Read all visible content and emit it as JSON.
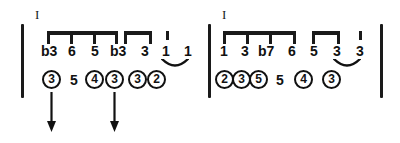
{
  "figure": {
    "type": "music-notation-diagram"
  },
  "colors": {
    "ink": "#111111",
    "rule": "#1a1a1a",
    "paper": "#ffffff"
  },
  "measures": [
    {
      "id": "measure-1",
      "roman_numeral": "I",
      "barlines": [
        {
          "name": "opening",
          "x": 21,
          "y": 24,
          "height": 74
        }
      ],
      "beam_groups": [
        {
          "id": "beam-group-1",
          "x": 47,
          "y": 31,
          "width": 71,
          "tick_offsets": [
            0,
            23,
            46,
            68
          ]
        },
        {
          "id": "beam-group-2",
          "x": 124,
          "y": 31,
          "width": 28,
          "tick_offsets": [
            0,
            25
          ]
        }
      ],
      "stem_ticks": [
        {
          "id": "stem-tick-1",
          "x": 166,
          "y": 31
        }
      ],
      "degrees": [
        {
          "label": "b3",
          "x": 41,
          "y": 44
        },
        {
          "label": "6",
          "x": 68,
          "y": 44
        },
        {
          "label": "5",
          "x": 91,
          "y": 44
        },
        {
          "label": "b3",
          "x": 110,
          "y": 44
        },
        {
          "label": "3",
          "x": 141,
          "y": 44
        },
        {
          "label": "1",
          "x": 162,
          "y": 44
        },
        {
          "label": "1",
          "x": 184,
          "y": 44
        }
      ],
      "ties": [
        {
          "id": "tie-1",
          "x": 161,
          "y": 55,
          "width": 28,
          "height": 10
        }
      ],
      "fingerings": [
        {
          "value": "3",
          "circled": true,
          "x": 42,
          "y": 70
        },
        {
          "value": "5",
          "circled": false,
          "x": 70,
          "y": 73
        },
        {
          "value": "4",
          "circled": true,
          "x": 85,
          "y": 70
        },
        {
          "value": "3",
          "circled": true,
          "x": 105,
          "y": 70
        },
        {
          "value": "3",
          "circled": true,
          "x": 128,
          "y": 70
        },
        {
          "value": "2",
          "circled": true,
          "x": 147,
          "y": 70
        }
      ],
      "arrows": [
        {
          "id": "arrow-1",
          "x": 51,
          "y": 92,
          "length": 40
        },
        {
          "id": "arrow-2",
          "x": 114,
          "y": 92,
          "length": 40
        }
      ]
    },
    {
      "id": "measure-2",
      "roman_numeral": "I",
      "barlines": [
        {
          "name": "opening",
          "x": 208,
          "y": 24,
          "height": 74
        },
        {
          "name": "closing",
          "x": 380,
          "y": 24,
          "height": 74
        }
      ],
      "beam_groups": [
        {
          "id": "beam-group-3",
          "x": 223,
          "y": 31,
          "width": 73,
          "tick_offsets": [
            0,
            23,
            46,
            70
          ]
        },
        {
          "id": "beam-group-4",
          "x": 312,
          "y": 31,
          "width": 28,
          "tick_offsets": [
            0,
            25
          ]
        }
      ],
      "stem_ticks": [
        {
          "id": "stem-tick-2",
          "x": 359,
          "y": 31
        }
      ],
      "degrees": [
        {
          "label": "1",
          "x": 220,
          "y": 44
        },
        {
          "label": "3",
          "x": 241,
          "y": 44
        },
        {
          "label": "b7",
          "x": 258,
          "y": 44
        },
        {
          "label": "6",
          "x": 288,
          "y": 44
        },
        {
          "label": "5",
          "x": 310,
          "y": 44
        },
        {
          "label": "3",
          "x": 333,
          "y": 44
        },
        {
          "label": "3",
          "x": 356,
          "y": 44
        }
      ],
      "ties": [
        {
          "id": "tie-2",
          "x": 333,
          "y": 55,
          "width": 28,
          "height": 10
        }
      ],
      "fingerings": [
        {
          "value": "2",
          "circled": true,
          "x": 215,
          "y": 70
        },
        {
          "value": "3",
          "circled": true,
          "x": 232,
          "y": 70
        },
        {
          "value": "5",
          "circled": true,
          "x": 249,
          "y": 70
        },
        {
          "value": "5",
          "circled": false,
          "x": 276,
          "y": 73
        },
        {
          "value": "4",
          "circled": true,
          "x": 294,
          "y": 70
        },
        {
          "value": "3",
          "circled": true,
          "x": 322,
          "y": 70
        }
      ],
      "arrows": []
    }
  ],
  "roman_numerals": [
    {
      "id": "roman-1",
      "label": "I",
      "x": 35,
      "y": 8
    },
    {
      "id": "roman-2",
      "label": "I",
      "x": 222,
      "y": 8
    }
  ]
}
